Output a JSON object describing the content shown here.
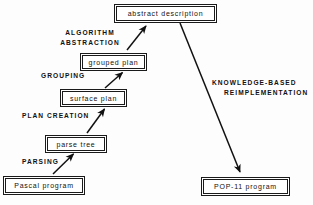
{
  "figure": {
    "ink_color": "#111111",
    "background_color": "#ffffff"
  },
  "boxes": {
    "abstract_description": "abstract description",
    "grouped_plan": "grouped plan",
    "surface_plan": "surface plan",
    "parse_tree": "parse tree",
    "pascal_program": "Pascal program",
    "pop11_program": "POP-11 program"
  },
  "phases": {
    "algorithm_abstraction_line1": "ALGORITHM",
    "algorithm_abstraction_line2": "ABSTRACTION",
    "grouping": "GROUPING",
    "plan_creation": "PLAN CREATION",
    "parsing": "PARSING",
    "knowledge_based_line1": "KNOWLEDGE-BASED",
    "knowledge_based_line2": "REIMPLEMENTATION"
  },
  "diagram_data": {
    "type": "flow-diagram",
    "nodes": [
      {
        "id": "pascal_program",
        "label": "Pascal program",
        "x": 5,
        "y": 178,
        "w": 78,
        "h": 15
      },
      {
        "id": "parse_tree",
        "label": "parse tree",
        "x": 47,
        "y": 137,
        "w": 58,
        "h": 14
      },
      {
        "id": "surface_plan",
        "label": "surface plan",
        "x": 62,
        "y": 91,
        "w": 63,
        "h": 14
      },
      {
        "id": "grouped_plan",
        "label": "grouped plan",
        "x": 82,
        "y": 55,
        "w": 63,
        "h": 14
      },
      {
        "id": "abstract_description",
        "label": "abstract description",
        "x": 116,
        "y": 6,
        "w": 99,
        "h": 15
      },
      {
        "id": "pop11_program",
        "label": "POP-11 program",
        "x": 203,
        "y": 179,
        "w": 85,
        "h": 15
      }
    ],
    "edges": [
      {
        "from": "pascal_program",
        "to": "parse_tree",
        "label": "PARSING"
      },
      {
        "from": "parse_tree",
        "to": "surface_plan",
        "label": "PLAN CREATION"
      },
      {
        "from": "surface_plan",
        "to": "grouped_plan",
        "label": "GROUPING"
      },
      {
        "from": "grouped_plan",
        "to": "abstract_description",
        "label": "ALGORITHM ABSTRACTION"
      },
      {
        "from": "abstract_description",
        "to": "pop11_program",
        "label": "KNOWLEDGE-BASED REIMPLEMENTATION"
      }
    ]
  }
}
